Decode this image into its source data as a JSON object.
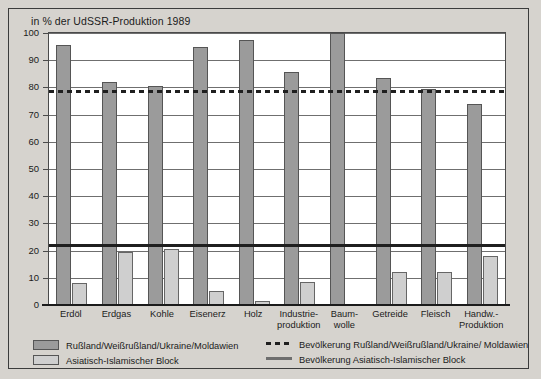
{
  "chart_data": {
    "type": "bar",
    "title": "in % der UdSSR-Produktion 1989",
    "xlabel": "",
    "ylabel": "",
    "ylim": [
      0,
      100
    ],
    "yticks": [
      0,
      10,
      20,
      30,
      40,
      50,
      60,
      70,
      80,
      90,
      100
    ],
    "grid": true,
    "legend_position": "bottom",
    "categories": [
      "Erdöl",
      "Erdgas",
      "Kohle",
      "Eisenerz",
      "Holz",
      "Industrie-\nproduktion",
      "Baum-\nwolle",
      "Getreide",
      "Fleisch",
      "Handw.-\nProduktion"
    ],
    "category_lines": [
      [
        "Erdöl",
        ""
      ],
      [
        "Erdgas",
        ""
      ],
      [
        "Kohle",
        ""
      ],
      [
        "Eisenerz",
        ""
      ],
      [
        "Holz",
        ""
      ],
      [
        "Industrie-",
        "produktion"
      ],
      [
        "Baum-",
        "wolle"
      ],
      [
        "Getreide",
        ""
      ],
      [
        "Fleisch",
        ""
      ],
      [
        "Handw.-",
        "Produktion"
      ]
    ],
    "series": [
      {
        "name": "Rußland/Weißrußland/Ukraine/Moldawien",
        "color": "#9b9b9b",
        "values": [
          95.5,
          82,
          80.5,
          95,
          97.5,
          85.5,
          100,
          83.5,
          79.5,
          74
        ]
      },
      {
        "name": "Asiatisch-Islamischer Block",
        "color": "#cfcfcf",
        "values": [
          8,
          19.5,
          20.5,
          5,
          1.5,
          8.5,
          0,
          12,
          12,
          18
        ]
      }
    ],
    "reference_lines": [
      {
        "name": "Bevölkerung Rußland/Weißrußland/Ukraine/ Moldawien",
        "value": 78.5,
        "style": "dashed",
        "color": "#1f1f1f"
      },
      {
        "name": "Bevölkerung Asiatisch-Islamischer Block",
        "value": 22,
        "style": "solid",
        "color": "#1f1f1f"
      }
    ]
  },
  "legend": {
    "items": [
      {
        "marker": "swatch-dark",
        "label": "Rußland/Weißrußland/Ukraine/Moldawien"
      },
      {
        "marker": "swatch-light",
        "label": "Asiatisch-Islamischer Block"
      },
      {
        "marker": "line-dashed",
        "label": "Bevölkerung Rußland/Weißrußland/Ukraine/ Moldawien"
      },
      {
        "marker": "line-solid",
        "label": "Bevölkerung Asiatisch-Islamischer Block"
      }
    ]
  }
}
